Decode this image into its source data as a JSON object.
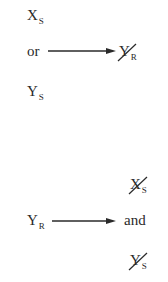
{
  "diagram": {
    "top": {
      "inputs": [
        {
          "main": "X",
          "sub": "S"
        },
        {
          "connector": "or"
        },
        {
          "main": "Y",
          "sub": "S"
        }
      ],
      "arrow": "right-arrow",
      "output": {
        "main": "Y",
        "sub": "R",
        "struck": true
      }
    },
    "bottom": {
      "input": {
        "main": "Y",
        "sub": "R"
      },
      "arrow": "right-arrow",
      "outputs": [
        {
          "main": "X",
          "sub": "S",
          "struck": true
        },
        {
          "connector": "and"
        },
        {
          "main": "Y",
          "sub": "S",
          "struck": true
        }
      ]
    },
    "colors": {
      "ink": "#2a2a2a",
      "background": "#ffffff"
    }
  }
}
